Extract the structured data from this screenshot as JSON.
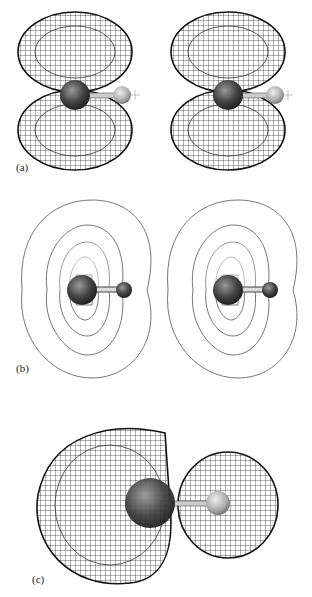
{
  "figure": {
    "panels": [
      {
        "id": "a",
        "label": "(a)",
        "description": "Two wireframe isosurface views of a p-type orbital with two lobes above and below a carbon-hydrogen bond"
      },
      {
        "id": "b",
        "label": "(b)",
        "description": "Two contour plots of the orbital in the molecular plane with C and H atoms"
      },
      {
        "id": "c",
        "label": "(c)",
        "description": "Wireframe isosurface of an sp-hybrid orbital with a large lobe on carbon and a smaller lobe on hydrogen"
      }
    ]
  }
}
